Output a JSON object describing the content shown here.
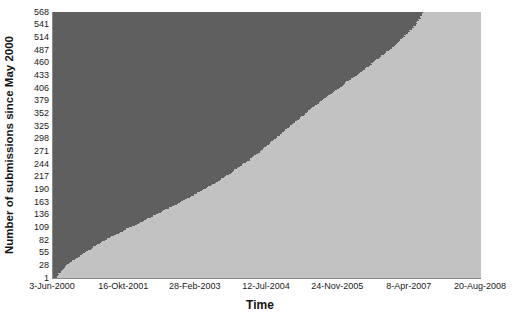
{
  "chart_data": {
    "type": "bar",
    "orientation": "horizontal",
    "title": "",
    "xlabel": "Time",
    "ylabel": "Number of submissions since May 2000",
    "grid": false,
    "legend": null,
    "y_tick_labels": [
      "568",
      "541",
      "514",
      "487",
      "460",
      "433",
      "406",
      "379",
      "352",
      "325",
      "298",
      "271",
      "244",
      "217",
      "190",
      "163",
      "136",
      "109",
      "82",
      "55",
      "28",
      "1"
    ],
    "y_tick_values": [
      568,
      541,
      514,
      487,
      460,
      433,
      406,
      379,
      352,
      325,
      298,
      271,
      244,
      217,
      190,
      163,
      136,
      109,
      82,
      55,
      28,
      1
    ],
    "ylim": [
      1,
      568
    ],
    "x_tick_labels": [
      "3-Jun-2000",
      "16-Okt-2001",
      "28-Feb-2003",
      "12-Jul-2004",
      "24-Nov-2005",
      "8-Apr-2007",
      "20-Aug-2008"
    ],
    "x_tick_values": [
      "2000-06-03",
      "2001-10-16",
      "2003-02-28",
      "2004-07-12",
      "2005-11-24",
      "2007-04-08",
      "2008-08-20"
    ],
    "xlim": [
      "2000-06-03",
      "2008-08-20"
    ],
    "series_name": "Cumulative submissions",
    "n_bars": 568,
    "colors": {
      "bar_fill": "#7e7e7e",
      "bar_separator": "#5f5f5f",
      "plot_background": "#c2c2c2",
      "axis_line": "#8a8a8a",
      "text": "#1a1a1a",
      "page_background": "#ffffff"
    },
    "envelope_points": [
      {
        "submission": 1,
        "x_fraction": 0.006
      },
      {
        "submission": 10,
        "x_fraction": 0.012
      },
      {
        "submission": 20,
        "x_fraction": 0.022
      },
      {
        "submission": 28,
        "x_fraction": 0.031
      },
      {
        "submission": 40,
        "x_fraction": 0.048
      },
      {
        "submission": 55,
        "x_fraction": 0.073
      },
      {
        "submission": 70,
        "x_fraction": 0.098
      },
      {
        "submission": 82,
        "x_fraction": 0.12
      },
      {
        "submission": 95,
        "x_fraction": 0.148
      },
      {
        "submission": 109,
        "x_fraction": 0.178
      },
      {
        "submission": 122,
        "x_fraction": 0.208
      },
      {
        "submission": 136,
        "x_fraction": 0.238
      },
      {
        "submission": 150,
        "x_fraction": 0.268
      },
      {
        "submission": 163,
        "x_fraction": 0.296
      },
      {
        "submission": 176,
        "x_fraction": 0.322
      },
      {
        "submission": 190,
        "x_fraction": 0.35
      },
      {
        "submission": 203,
        "x_fraction": 0.375
      },
      {
        "submission": 217,
        "x_fraction": 0.4
      },
      {
        "submission": 230,
        "x_fraction": 0.421
      },
      {
        "submission": 244,
        "x_fraction": 0.443
      },
      {
        "submission": 258,
        "x_fraction": 0.464
      },
      {
        "submission": 271,
        "x_fraction": 0.482
      },
      {
        "submission": 285,
        "x_fraction": 0.5
      },
      {
        "submission": 298,
        "x_fraction": 0.517
      },
      {
        "submission": 312,
        "x_fraction": 0.535
      },
      {
        "submission": 325,
        "x_fraction": 0.551
      },
      {
        "submission": 339,
        "x_fraction": 0.57
      },
      {
        "submission": 352,
        "x_fraction": 0.588
      },
      {
        "submission": 366,
        "x_fraction": 0.607
      },
      {
        "submission": 379,
        "x_fraction": 0.625
      },
      {
        "submission": 393,
        "x_fraction": 0.645
      },
      {
        "submission": 406,
        "x_fraction": 0.665
      },
      {
        "submission": 420,
        "x_fraction": 0.686
      },
      {
        "submission": 433,
        "x_fraction": 0.706
      },
      {
        "submission": 447,
        "x_fraction": 0.727
      },
      {
        "submission": 460,
        "x_fraction": 0.745
      },
      {
        "submission": 474,
        "x_fraction": 0.765
      },
      {
        "submission": 487,
        "x_fraction": 0.783
      },
      {
        "submission": 501,
        "x_fraction": 0.8
      },
      {
        "submission": 514,
        "x_fraction": 0.815
      },
      {
        "submission": 528,
        "x_fraction": 0.832
      },
      {
        "submission": 541,
        "x_fraction": 0.845
      },
      {
        "submission": 555,
        "x_fraction": 0.855
      },
      {
        "submission": 568,
        "x_fraction": 0.862
      }
    ]
  }
}
